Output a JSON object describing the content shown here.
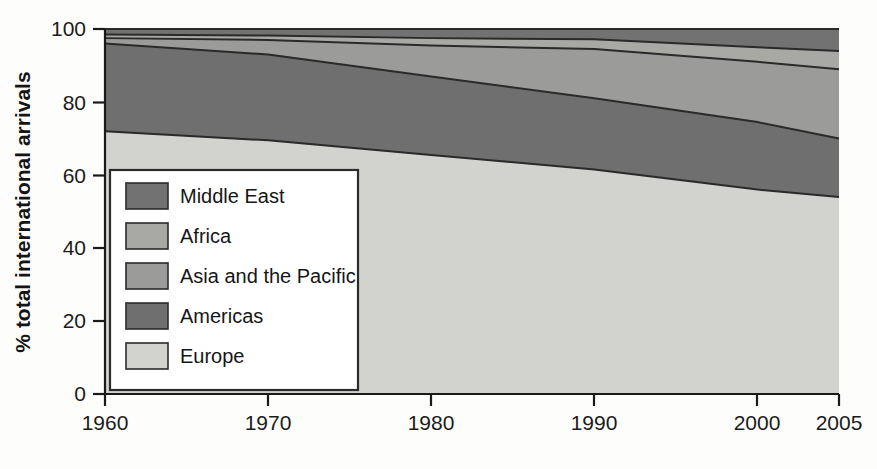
{
  "chart_data": {
    "type": "area",
    "stacked": true,
    "title": "",
    "subtitle": "",
    "xlabel": "",
    "ylabel": "% total international arrivals",
    "x": [
      1960,
      1970,
      1980,
      1990,
      2000,
      2005
    ],
    "x_tick_labels": [
      "1960",
      "1970",
      "1980",
      "1990",
      "2000",
      "2005"
    ],
    "y_tick_labels": [
      "0",
      "20",
      "40",
      "60",
      "80",
      "100"
    ],
    "y_ticks": [
      0,
      20,
      40,
      60,
      80,
      100
    ],
    "xlim": [
      1960,
      2005
    ],
    "ylim": [
      0,
      100
    ],
    "grid": false,
    "legend_position": "inside-lower-left",
    "stack_order_bottom_to_top": [
      "Europe",
      "Americas",
      "Asia and the Pacific",
      "Africa",
      "Middle East"
    ],
    "series": [
      {
        "name": "Europe",
        "color": "#d2d2cf",
        "values": [
          72.0,
          69.5,
          65.5,
          61.5,
          56.0,
          54.0
        ],
        "cumulative_top": [
          72.0,
          69.5,
          65.5,
          61.5,
          56.0,
          54.0
        ]
      },
      {
        "name": "Americas",
        "color": "#6f6f6f",
        "values": [
          24.0,
          23.5,
          21.5,
          19.5,
          18.5,
          16.0
        ],
        "cumulative_top": [
          96.0,
          93.0,
          87.0,
          81.0,
          74.5,
          70.0
        ]
      },
      {
        "name": "Asia and the Pacific",
        "color": "#9b9b99",
        "values": [
          1.5,
          4.0,
          8.5,
          13.5,
          16.5,
          19.0
        ],
        "cumulative_top": [
          97.5,
          97.0,
          95.5,
          94.5,
          91.0,
          89.0
        ]
      },
      {
        "name": "Africa",
        "color": "#a8a8a5",
        "values": [
          1.0,
          1.2,
          2.0,
          2.7,
          4.0,
          5.0
        ],
        "cumulative_top": [
          98.5,
          98.2,
          97.5,
          97.2,
          95.0,
          94.0
        ]
      },
      {
        "name": "Middle East",
        "color": "#727272",
        "values": [
          1.5,
          1.8,
          2.5,
          2.8,
          5.0,
          6.0
        ],
        "cumulative_top": [
          100.0,
          100.0,
          100.0,
          100.0,
          100.0,
          100.0
        ]
      }
    ],
    "legend_entries": [
      {
        "label": "Middle East",
        "color": "#727272"
      },
      {
        "label": "Africa",
        "color": "#a8a8a5"
      },
      {
        "label": "Asia and the Pacific",
        "color": "#9b9b99"
      },
      {
        "label": "Americas",
        "color": "#6f6f6f"
      },
      {
        "label": "Europe",
        "color": "#d2d2cf"
      }
    ]
  },
  "axes": {
    "y_axis_title": "% total international arrivals",
    "y_tick_0": "0",
    "y_tick_20": "20",
    "y_tick_40": "40",
    "y_tick_60": "60",
    "y_tick_80": "80",
    "y_tick_100": "100",
    "x_tick_1960": "1960",
    "x_tick_1970": "1970",
    "x_tick_1980": "1980",
    "x_tick_1990": "1990",
    "x_tick_2000": "2000",
    "x_tick_2005": "2005"
  },
  "legend": {
    "items": [
      {
        "label": "Middle East"
      },
      {
        "label": "Africa"
      },
      {
        "label": "Asia and the Pacific"
      },
      {
        "label": "Americas"
      },
      {
        "label": "Europe"
      }
    ]
  },
  "colors": {
    "europe": "#d2d2cf",
    "americas": "#6f6f6f",
    "asia_pacific": "#9b9b99",
    "africa": "#a8a8a5",
    "middle_east": "#727272",
    "axis": "#1a1a1a",
    "background": "#fdfdfc"
  }
}
